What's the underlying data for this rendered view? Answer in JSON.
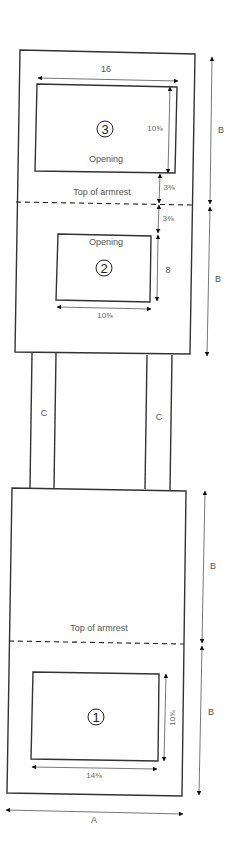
{
  "diagram": {
    "upper_panel": {
      "opening_3": {
        "number": "3",
        "label": "Opening",
        "width": "16",
        "height": "10⅝"
      },
      "armrest_label": "Top of armrest",
      "gap_above_armrest": "3⅜",
      "gap_below_armrest": "3⅜",
      "opening_2": {
        "number": "2",
        "label": "Opening",
        "width": "10⅝",
        "height": "8"
      },
      "dimension_B_top": "B",
      "dimension_B_bottom": "B"
    },
    "legs": {
      "left_label": "C",
      "right_label": "C"
    },
    "lower_panel": {
      "dimension_B_top": "B",
      "armrest_label": "Top of armrest",
      "opening_1": {
        "number": "1",
        "width": "14⅜",
        "height": "10⅝"
      },
      "dimension_B_bottom": "B",
      "dimension_A": "A"
    }
  }
}
